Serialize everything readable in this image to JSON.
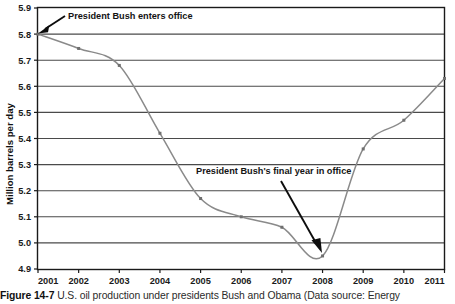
{
  "figure": {
    "caption_label": "Figure 14-7",
    "caption_text": "U.S. oil production under presidents Bush and Obama (Data source: Energy"
  },
  "chart_data": {
    "type": "line",
    "title": "",
    "xlabel": "",
    "ylabel": "Million barrels per day",
    "categories": [
      "2001",
      "2002",
      "2003",
      "2004",
      "2005",
      "2006",
      "2007",
      "2008",
      "2009",
      "2010",
      "2011"
    ],
    "x": [
      2001,
      2002,
      2003,
      2004,
      2005,
      2006,
      2007,
      2008,
      2009,
      2010,
      2011
    ],
    "values": [
      5.8,
      5.745,
      5.68,
      5.42,
      5.17,
      5.1,
      5.06,
      4.95,
      5.36,
      5.47,
      5.63
    ],
    "series": [
      {
        "name": "U.S. oil production",
        "values": [
          5.8,
          5.745,
          5.68,
          5.42,
          5.17,
          5.1,
          5.06,
          4.95,
          5.36,
          5.47,
          5.63
        ]
      }
    ],
    "xlim": [
      2001,
      2011
    ],
    "ylim": [
      4.9,
      5.9
    ],
    "yticks": [
      "5.9",
      "5.8",
      "5.7",
      "5.6",
      "5.5",
      "5.4",
      "5.3",
      "5.2",
      "5.1",
      "5.0",
      "4.9"
    ],
    "ytick_values": [
      5.9,
      5.8,
      5.7,
      5.6,
      5.5,
      5.4,
      5.3,
      5.2,
      5.1,
      5.0,
      4.9
    ],
    "xticks": [
      "2001",
      "2002",
      "2003",
      "2004",
      "2005",
      "2006",
      "2007",
      "2008",
      "2009",
      "2010",
      "2011"
    ],
    "grid": "horizontal",
    "legend": "none",
    "markers": true,
    "line_color": "#8a8a8a",
    "grid_color": "#4a4a4a",
    "annotations": [
      {
        "id": "bush-enters-office",
        "text": "President Bush enters office",
        "target_x": 2001,
        "target_y": 5.8
      },
      {
        "id": "bush-final-year",
        "text": "President Bush's final year in office",
        "target_x": 2008,
        "target_y": 4.95
      }
    ]
  },
  "colors": {
    "line": "#8a8a8a",
    "grid": "#4a4a4a",
    "frame": "#1a1a1a",
    "annotation_arrow": "#0d0d0d",
    "text": "#111111"
  }
}
